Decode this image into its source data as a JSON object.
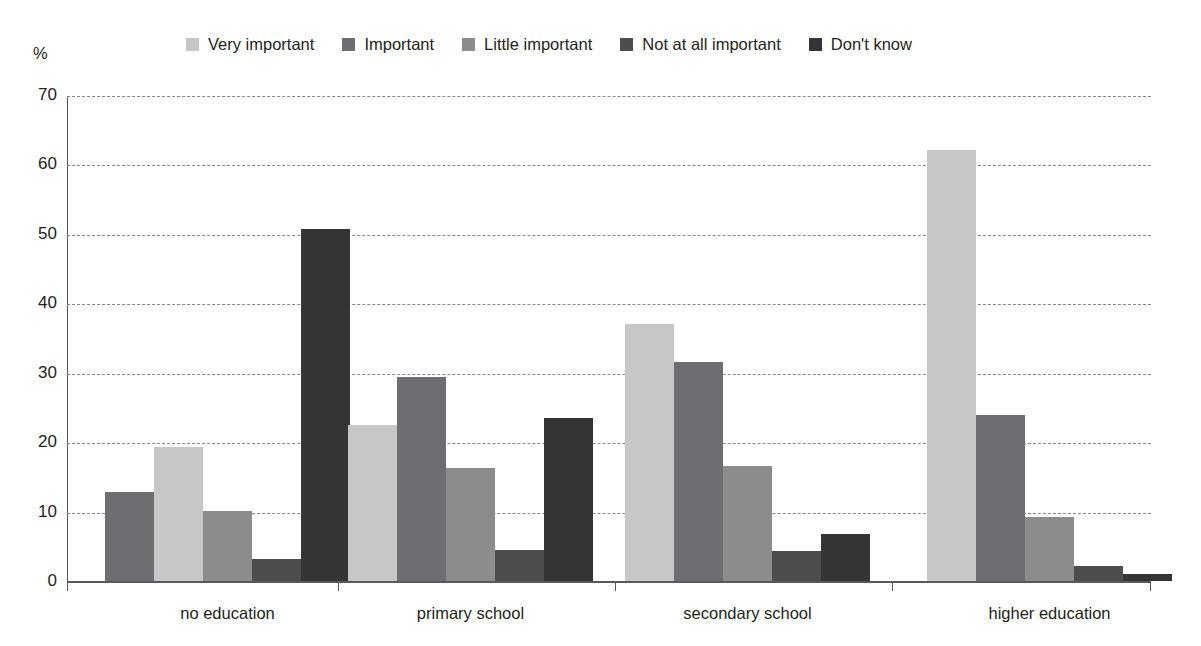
{
  "chart_data": {
    "type": "bar",
    "title": "",
    "subtitle": "",
    "xlabel": "",
    "ylabel": "%",
    "ylim": [
      0,
      70
    ],
    "yticks": [
      0,
      10,
      20,
      30,
      40,
      50,
      60,
      70
    ],
    "grid": true,
    "legend_position": "top",
    "categories": [
      "no education",
      "primary school",
      "secondary school",
      "higher education"
    ],
    "series": [
      {
        "name": "Very important",
        "color": "#c6c7c9",
        "values": [
          19.3,
          22.4,
          37.0,
          62.1
        ]
      },
      {
        "name": "Important",
        "color": "#6d6e71",
        "values": [
          12.8,
          29.4,
          31.6,
          23.9
        ]
      },
      {
        "name": "Little important",
        "color": "#8a8c8e",
        "values": [
          10.1,
          16.3,
          16.6,
          9.2
        ]
      },
      {
        "name": "Not at all important",
        "color": "#4c4d4f",
        "values": [
          3.1,
          4.4,
          4.3,
          2.2
        ]
      },
      {
        "name": "Don't know",
        "color": "#343537",
        "values": [
          50.7,
          23.5,
          6.8,
          1.0
        ]
      }
    ],
    "group_series_order": [
      [
        "Important",
        "Very important",
        "Little important",
        "Not at all important",
        "Don't know"
      ],
      [
        "Very important",
        "Important",
        "Little important",
        "Not at all important",
        "Don't know"
      ],
      [
        "Very important",
        "Important",
        "Little important",
        "Not at all important",
        "Don't know"
      ],
      [
        "Very important",
        "Important",
        "Little important",
        "Not at all important",
        "Don't know"
      ]
    ]
  },
  "legend": {
    "items": [
      {
        "label": "Very important",
        "color": "#c6c7c9"
      },
      {
        "label": "Important",
        "color": "#6d6e71"
      },
      {
        "label": "Little important",
        "color": "#8a8c8e"
      },
      {
        "label": "Not at all important",
        "color": "#4c4d4f"
      },
      {
        "label": "Don't know",
        "color": "#343537"
      }
    ]
  },
  "axes": {
    "y_unit": "%",
    "y_tick_labels": [
      "70",
      "60",
      "50",
      "40",
      "30",
      "20",
      "10",
      "0"
    ],
    "x_tick_labels": [
      "no education",
      "primary school",
      "secondary school",
      "higher education"
    ]
  },
  "colors": {
    "axis": "#58595b",
    "gridline": "#86888b",
    "text": "#231f20",
    "background": "#ffffff"
  }
}
